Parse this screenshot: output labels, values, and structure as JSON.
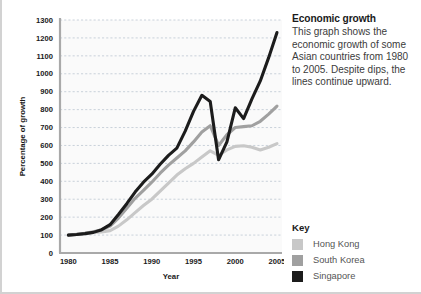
{
  "panel": {
    "title": "Economic growth",
    "body": "This graph shows the economic growth of some Asian countries from 1980 to 2005. Despite dips, the lines continue upward."
  },
  "key": {
    "title": "Key",
    "items": [
      {
        "label": "Hong Kong",
        "color": "#c8c8c8"
      },
      {
        "label": "South Korea",
        "color": "#a0a0a0"
      },
      {
        "label": "Singapore",
        "color": "#1c1c1c"
      }
    ]
  },
  "chart_data": {
    "type": "line",
    "title": "Economic growth",
    "xlabel": "Year",
    "ylabel": "Percentage of growth",
    "xlim": [
      1979,
      2005.6
    ],
    "ylim": [
      0,
      1300
    ],
    "grid": true,
    "legend_position": "right",
    "yticks": [
      0,
      100,
      200,
      300,
      400,
      500,
      600,
      700,
      800,
      900,
      1000,
      1100,
      1200,
      1300
    ],
    "xticks": [
      1980,
      1985,
      1990,
      1995,
      2000,
      2005
    ],
    "x": [
      1980,
      1981,
      1982,
      1983,
      1984,
      1985,
      1986,
      1987,
      1988,
      1989,
      1990,
      1991,
      1992,
      1993,
      1994,
      1995,
      1996,
      1997,
      1998,
      1999,
      2000,
      2001,
      2002,
      2003,
      2004,
      2005
    ],
    "series": [
      {
        "name": "Hong Kong",
        "color": "#c8c8c8",
        "width": 3.1,
        "values": [
          100,
          105,
          110,
          115,
          118,
          125,
          150,
          185,
          225,
          265,
          300,
          345,
          390,
          435,
          470,
          500,
          535,
          570,
          545,
          575,
          595,
          598,
          590,
          575,
          590,
          610
        ]
      },
      {
        "name": "South Korea",
        "color": "#a0a0a0",
        "width": 3.1,
        "values": [
          100,
          104,
          110,
          118,
          130,
          150,
          195,
          250,
          305,
          350,
          395,
          445,
          490,
          530,
          570,
          620,
          675,
          710,
          600,
          660,
          700,
          705,
          710,
          735,
          775,
          820
        ]
      },
      {
        "name": "Singapore",
        "color": "#1c1c1c",
        "width": 3.1,
        "values": [
          100,
          103,
          108,
          115,
          130,
          158,
          215,
          275,
          340,
          395,
          440,
          495,
          545,
          585,
          680,
          790,
          880,
          845,
          520,
          620,
          810,
          750,
          860,
          960,
          1090,
          1230
        ]
      }
    ]
  }
}
